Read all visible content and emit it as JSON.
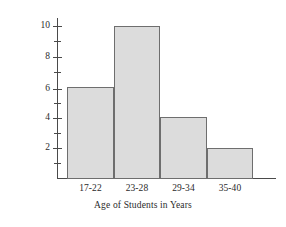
{
  "chart_data": {
    "type": "bar",
    "title": "",
    "subtitle": "",
    "xlabel": "Age of Students in Years",
    "ylabel": "Number of Students in Hundreds",
    "categories": [
      "17-22",
      "23-28",
      "29-34",
      "35-40"
    ],
    "values": [
      6,
      10,
      4,
      2
    ],
    "series": [
      {
        "name": "Number of Students in Hundreds",
        "values": [
          6,
          10,
          4,
          2
        ]
      }
    ],
    "ylim": [
      0,
      10.6
    ],
    "xlim": [
      0,
      4
    ],
    "y_major_ticks": [
      2,
      4,
      6,
      8,
      10
    ],
    "y_major_tick_labels": [
      "2",
      "4",
      "6",
      "8",
      "10"
    ],
    "y_minor_ticks": [
      1,
      3,
      5,
      7,
      9
    ],
    "grid": false,
    "legend": false,
    "legend_position": "none",
    "bar_fill_color": "#dcdcdc",
    "bar_edge_color": "#6e6e6e",
    "axis_color": "#4a4a4a",
    "background_color": "#ffffff",
    "bars_contiguous": true
  }
}
